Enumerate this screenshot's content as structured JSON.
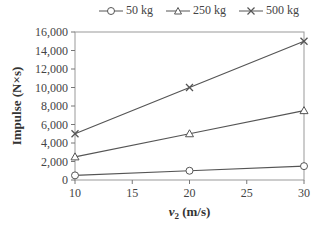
{
  "chart_data": {
    "type": "line",
    "title": "",
    "xlabel": "v2 (m/s)",
    "xlabel_main": "v",
    "xlabel_sub": "2",
    "xlabel_unit": " (m/s)",
    "ylabel": "Impulse (N×s)",
    "x": [
      10,
      20,
      30
    ],
    "xlim": [
      10,
      30
    ],
    "ylim": [
      0,
      16000
    ],
    "xticks": [
      10,
      15,
      20,
      25,
      30
    ],
    "yticks": [
      0,
      2000,
      4000,
      6000,
      8000,
      10000,
      12000,
      14000,
      16000
    ],
    "ytick_labels": [
      "0",
      "2,000",
      "4,000",
      "6,000",
      "8,000",
      "10,000",
      "12,000",
      "14,000",
      "16,000"
    ],
    "grid": false,
    "legend_position": "top",
    "series": [
      {
        "name": "50 kg",
        "marker": "circle",
        "values": [
          500,
          1000,
          1500
        ]
      },
      {
        "name": "250 kg",
        "marker": "triangle",
        "values": [
          2500,
          5000,
          7500
        ]
      },
      {
        "name": "500 kg",
        "marker": "x",
        "values": [
          5000,
          10000,
          15000
        ]
      }
    ]
  },
  "colors": {
    "line": "#555555",
    "axis": "#777777",
    "text": "#444444"
  }
}
